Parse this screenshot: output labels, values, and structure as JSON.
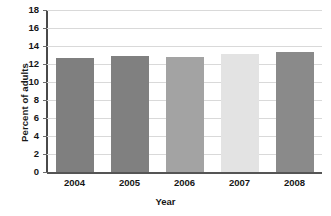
{
  "chart_data": {
    "type": "bar",
    "title": "",
    "categories": [
      "2004",
      "2005",
      "2006",
      "2007",
      "2008"
    ],
    "values": [
      12.7,
      12.9,
      12.8,
      13.1,
      13.3
    ],
    "series": [
      {
        "name": "Percent of adults",
        "values": [
          12.7,
          12.9,
          12.8,
          13.1,
          13.3
        ]
      }
    ],
    "xlabel": "Year",
    "ylabel": "Percent of adults",
    "ylim": [
      0,
      18
    ],
    "ytick_step": 2,
    "yticks": [
      "18",
      "16",
      "14",
      "12",
      "10",
      "8",
      "6",
      "4",
      "2",
      "0"
    ],
    "ytick_values": [
      18,
      16,
      14,
      12,
      10,
      8,
      6,
      4,
      2,
      0
    ],
    "grid": "horizontal",
    "legend": "none",
    "bar_colors": [
      "#7f7f7f",
      "#808080",
      "#a3a3a3",
      "#e3e3e3",
      "#8a8a8a"
    ],
    "gridline_color": "#d9d9d9",
    "axis_color": "#4a4a4a",
    "background": "#ffffff"
  },
  "page": {
    "bleed_top": "",
    "bleed_bottom": ""
  }
}
